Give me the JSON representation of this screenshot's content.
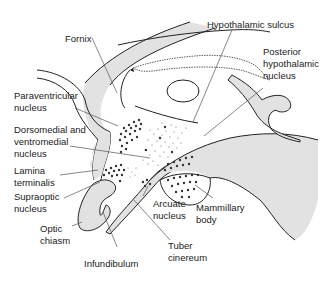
{
  "diagram": {
    "colors": {
      "fill": "#e2e2e2",
      "stroke": "#222222",
      "leader": "#555555",
      "dots": "#333333"
    },
    "labels": {
      "fornix": "Fornix",
      "hypothalamic_sulcus": "Hypothalamic sulcus",
      "posterior_hypothalamic_nucleus": "Posterior\nhypothalamic\nnucleus",
      "paraventricular_nucleus": "Paraventricular\nnucleus",
      "dorsomedial_ventromedial_nucleus": "Dorsomedial and\nventromedial\nnucleus",
      "lamina_terminalis": "Lamina\nterminalis",
      "supraoptic_nucleus": "Supraoptic\nnucleus",
      "optic_chiasm": "Optic\nchiasm",
      "infundibulum": "Infundibulum",
      "arcuate_nucleus": "Arcuate\nnucleus",
      "tuber_cinereum": "Tuber\ncinereum",
      "mammillary_body": "Mammillary\nbody"
    }
  }
}
